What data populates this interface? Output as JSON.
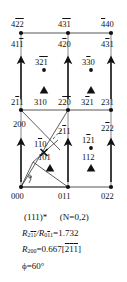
{
  "figure": {
    "type": "reciprocal-lattice-net",
    "colors": {
      "ink": "#111111",
      "line": "#333333",
      "background": "#ffffff"
    }
  },
  "nodes": [
    {
      "id": "n-422",
      "label": "422",
      "overline": "0,1,2",
      "x": 21,
      "y": 33,
      "marker": "dot",
      "label_pos": "above"
    },
    {
      "id": "n-431",
      "label": "431",
      "overline": "0,1",
      "x": 68,
      "y": 33,
      "marker": "dot",
      "label_pos": "above"
    },
    {
      "id": "n-440",
      "label": "440",
      "overline": "0",
      "x": 111,
      "y": 33,
      "marker": "dot",
      "label_pos": "above"
    },
    {
      "id": "n-211",
      "label": "211",
      "overline": "0",
      "x": 21,
      "y": 110,
      "marker": "dot",
      "label_pos": "above"
    },
    {
      "id": "n-220",
      "label": "220",
      "overline": "0,1",
      "x": 68,
      "y": 110,
      "marker": "dot",
      "label_pos": "above"
    },
    {
      "id": "n-231",
      "label": "231",
      "overline": "",
      "x": 111,
      "y": 110,
      "marker": "dot",
      "label_pos": "above"
    },
    {
      "id": "n-000",
      "label": "000",
      "overline": "",
      "x": 21,
      "y": 187,
      "marker": "dot",
      "label_pos": "below"
    },
    {
      "id": "n-011",
      "label": "011",
      "overline": "",
      "x": 68,
      "y": 187,
      "marker": "dot",
      "label_pos": "below"
    },
    {
      "id": "n-022",
      "label": "022",
      "overline": "",
      "x": 111,
      "y": 187,
      "marker": "dot",
      "label_pos": "below"
    }
  ],
  "labels": {
    "row_top": [
      {
        "name": "label-422",
        "text": "422",
        "bars": [
          1,
          2
        ]
      },
      {
        "name": "label-431",
        "text": "431",
        "bars": [
          1,
          2
        ]
      },
      {
        "name": "label-440",
        "text": "440",
        "bars": [
          1
        ]
      }
    ],
    "row_second": [
      {
        "name": "label-411",
        "text": "411",
        "bars": [
          2
        ]
      },
      {
        "name": "label-420",
        "text": "420",
        "bars": [
          1
        ]
      },
      {
        "name": "label-431b",
        "text": "431",
        "bars": [
          1
        ]
      }
    ],
    "row_dots": [
      {
        "name": "label-321",
        "text": "321",
        "bars": [
          1,
          2
        ]
      },
      {
        "name": "label-330",
        "text": "330",
        "bars": [
          1
        ]
      }
    ],
    "row_mid": [
      {
        "name": "label-211",
        "text": "211",
        "bars": [
          1
        ]
      },
      {
        "name": "label-310",
        "text": "310",
        "bars": []
      },
      {
        "name": "label-220",
        "text": "220",
        "bars": [
          1,
          2
        ]
      },
      {
        "name": "label-321b",
        "text": "321",
        "bars": [
          1
        ]
      },
      {
        "name": "label-231",
        "text": "231",
        "bars": []
      }
    ],
    "row_vectors": [
      {
        "name": "label-200",
        "text": "200",
        "bars": []
      },
      {
        "name": "label-211b",
        "text": "211",
        "bars": [
          1
        ]
      },
      {
        "name": "label-222",
        "text": "222",
        "bars": [
          1
        ]
      }
    ],
    "row_inner": [
      {
        "name": "label-110",
        "text": "110",
        "bars": [
          1
        ]
      },
      {
        "name": "label-121",
        "text": "121",
        "bars": [
          1
        ]
      },
      {
        "name": "label-101",
        "text": "101",
        "bars": []
      },
      {
        "name": "label-112",
        "text": "112",
        "bars": []
      }
    ],
    "row_bottom": [
      {
        "name": "label-000",
        "text": "000",
        "bars": []
      },
      {
        "name": "label-011",
        "text": "011",
        "bars": []
      },
      {
        "name": "label-022",
        "text": "022",
        "bars": []
      }
    ],
    "angle_symbol": "ϕ"
  },
  "caption": {
    "line1_zone": "(111)*",
    "line1_n": "(N=0,2)",
    "line2_prefix": "R",
    "line2_sub1": "211",
    "line2_slash": "/R",
    "line2_sub2": "011",
    "line2_value": "=1.732",
    "line3_prefix": "R",
    "line3_sub": "200",
    "line3_value": "=0.667[211]",
    "line4": "ϕ=60°",
    "line4_symbol": "ϕ",
    "line4_eq": "=60°"
  },
  "markers": {
    "dot_positions": [
      {
        "name": "marker-dot-321",
        "x": 44,
        "y": 67
      },
      {
        "name": "marker-dot-330",
        "x": 91,
        "y": 67
      },
      {
        "name": "marker-dot-121",
        "x": 91,
        "y": 146
      }
    ],
    "triangle_positions": [
      {
        "name": "marker-tri-310",
        "x": 44,
        "y": 91
      },
      {
        "name": "marker-tri-321",
        "x": 91,
        "y": 91
      },
      {
        "name": "marker-tri-101",
        "x": 50,
        "y": 169
      },
      {
        "name": "marker-tri-112",
        "x": 91,
        "y": 169
      }
    ],
    "cross_positions": [
      {
        "name": "marker-cross-110",
        "x": 44,
        "y": 152
      }
    ]
  },
  "arrows": {
    "vertical": [
      {
        "name": "arrow-411",
        "x": 21,
        "y1": 98,
        "y2": 56
      },
      {
        "name": "arrow-420",
        "x": 68,
        "y1": 98,
        "y2": 56
      },
      {
        "name": "arrow-431",
        "x": 111,
        "y1": 98,
        "y2": 56
      },
      {
        "name": "arrow-200",
        "x": 21,
        "y1": 180,
        "y2": 136
      },
      {
        "name": "arrow-211",
        "x": 68,
        "y1": 180,
        "y2": 136
      },
      {
        "name": "arrow-222",
        "x": 111,
        "y1": 180,
        "y2": 136
      }
    ]
  }
}
